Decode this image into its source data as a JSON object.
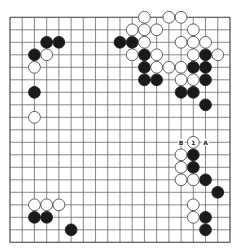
{
  "board": {
    "size": 19,
    "origin_x": 10,
    "origin_y": 17.3,
    "spacing_x": 12.22,
    "spacing_y": 12.5,
    "stone_radius": 5.9,
    "colors": {
      "black": "#1a1a1a",
      "white": "#ffffff",
      "line": "#555555"
    }
  },
  "stones": {
    "black": [
      [
        4,
        3
      ],
      [
        5,
        3
      ],
      [
        3,
        4
      ],
      [
        3,
        7
      ],
      [
        10,
        3
      ],
      [
        11,
        3
      ],
      [
        12,
        4
      ],
      [
        12,
        5
      ],
      [
        12,
        6
      ],
      [
        13,
        6
      ],
      [
        17,
        4
      ],
      [
        16,
        5
      ],
      [
        17,
        5
      ],
      [
        17,
        6
      ],
      [
        15,
        7
      ],
      [
        16,
        7
      ],
      [
        17,
        8
      ],
      [
        16,
        12
      ],
      [
        16,
        13
      ],
      [
        17,
        14
      ],
      [
        18,
        15
      ],
      [
        17,
        17
      ],
      [
        17,
        18
      ],
      [
        3,
        17
      ],
      [
        4,
        17
      ],
      [
        6,
        18
      ]
    ],
    "white": [
      [
        4,
        4
      ],
      [
        3,
        5
      ],
      [
        3,
        9
      ],
      [
        12,
        1
      ],
      [
        14,
        1
      ],
      [
        15,
        1
      ],
      [
        11,
        2
      ],
      [
        12,
        2
      ],
      [
        13,
        2
      ],
      [
        16,
        2
      ],
      [
        12,
        3
      ],
      [
        15,
        3
      ],
      [
        16,
        3
      ],
      [
        17,
        3
      ],
      [
        11,
        4
      ],
      [
        13,
        4
      ],
      [
        16,
        4
      ],
      [
        18,
        4
      ],
      [
        13,
        5
      ],
      [
        14,
        5
      ],
      [
        15,
        5
      ],
      [
        15,
        6
      ],
      [
        16,
        6
      ],
      [
        16,
        11
      ],
      [
        15,
        12
      ],
      [
        15,
        13
      ],
      [
        15,
        14
      ],
      [
        16,
        14
      ],
      [
        16,
        16
      ],
      [
        16,
        17
      ],
      [
        3,
        16
      ],
      [
        4,
        16
      ],
      [
        5,
        16
      ]
    ]
  },
  "markers": [
    {
      "col": 16,
      "row": 11,
      "text": "1",
      "on_stone": "white"
    },
    {
      "col": 15,
      "row": 11,
      "text": "B",
      "on_stone": null
    },
    {
      "col": 17,
      "row": 11,
      "text": "A",
      "on_stone": null
    }
  ]
}
